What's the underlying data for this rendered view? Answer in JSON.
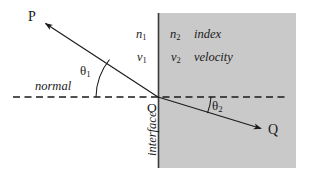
{
  "figure": {
    "colors": {
      "medium2_fill": "#c9c9c9",
      "line": "#1a1a1a",
      "interface_line": "#3a3a3a",
      "background": "#ffffff"
    },
    "geometry": {
      "origin": {
        "x": 158,
        "y": 97
      },
      "interface_x": 158,
      "normal_y": 97,
      "normal_x_start": 13,
      "normal_x_end": 289,
      "medium2_rect": {
        "x": 158,
        "y": 13,
        "width": 138,
        "height": 155
      },
      "incident_ray": {
        "from": {
          "x": 158,
          "y": 97
        },
        "to": {
          "x": 43,
          "y": 22
        }
      },
      "refracted_ray": {
        "from": {
          "x": 158,
          "y": 97
        },
        "to": {
          "x": 263,
          "y": 129
        }
      },
      "theta1_degrees": 33,
      "theta2_degrees": 73
    },
    "labels": {
      "point_p": "P",
      "point_o": "O",
      "point_q": "Q",
      "theta1": "θ",
      "theta1_sub": "1",
      "theta2": "θ",
      "theta2_sub": "2",
      "normal": "normal",
      "interface": "interface",
      "n1": "n",
      "n1_sub": "1",
      "v1": "v",
      "v1_sub": "1",
      "n2": "n",
      "n2_sub": "2",
      "v2": "v",
      "v2_sub": "2",
      "index": "index",
      "velocity": "velocity"
    }
  }
}
